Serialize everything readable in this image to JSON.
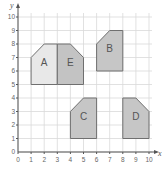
{
  "chart_data": {
    "type": "coordinate-grid",
    "title": "",
    "xlabel": "x",
    "ylabel": "y",
    "xlim": [
      0,
      10
    ],
    "ylim": [
      0,
      10
    ],
    "grid": true,
    "x_ticks": [
      "0",
      "1",
      "2",
      "3",
      "4",
      "5",
      "6",
      "7",
      "8",
      "9",
      "10"
    ],
    "y_ticks": [
      "0",
      "1",
      "2",
      "3",
      "4",
      "5",
      "6",
      "7",
      "8",
      "9",
      "10"
    ],
    "shapes": [
      {
        "label": "A",
        "fill": "#e8e8e8",
        "vertices": [
          [
            1,
            5
          ],
          [
            1,
            7
          ],
          [
            2,
            8
          ],
          [
            3,
            8
          ],
          [
            3,
            5
          ]
        ]
      },
      {
        "label": "E",
        "fill": "#c3c3c3",
        "vertices": [
          [
            3,
            5
          ],
          [
            3,
            8
          ],
          [
            4,
            8
          ],
          [
            5,
            7
          ],
          [
            5,
            5
          ]
        ]
      },
      {
        "label": "B",
        "fill": "#c6c6c6",
        "vertices": [
          [
            6,
            6
          ],
          [
            6,
            8
          ],
          [
            7,
            9
          ],
          [
            8,
            9
          ],
          [
            8,
            6
          ]
        ]
      },
      {
        "label": "C",
        "fill": "#c6c6c6",
        "vertices": [
          [
            4,
            1
          ],
          [
            4,
            3
          ],
          [
            5,
            4
          ],
          [
            6,
            4
          ],
          [
            6,
            1
          ]
        ]
      },
      {
        "label": "D",
        "fill": "#c6c6c6",
        "vertices": [
          [
            8,
            1
          ],
          [
            8,
            4
          ],
          [
            9,
            4
          ],
          [
            10,
            3
          ],
          [
            10,
            1
          ]
        ]
      }
    ]
  }
}
